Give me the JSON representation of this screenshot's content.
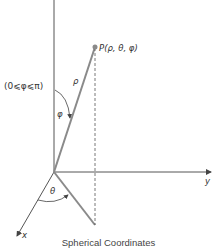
{
  "diagram": {
    "point_label": "P(ρ, θ, φ)",
    "rho_label": "ρ",
    "phi_label": "φ",
    "theta_label": "θ",
    "phi_range_label": "(0⩽φ⩽π)",
    "x_axis_label": "x",
    "y_axis_label": "y",
    "caption": "Spherical Coordinates",
    "colors": {
      "axis": "#555555",
      "vector": "#8a8a8a",
      "dashed": "#555555"
    }
  }
}
